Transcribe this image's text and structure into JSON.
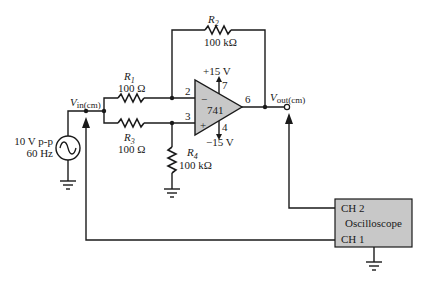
{
  "diagram": {
    "source": {
      "amplitude": "10 V p-p",
      "frequency": "60 Hz",
      "icon": "ac-source-icon"
    },
    "nodes": {
      "vin": {
        "main": "V",
        "sub": "in(cm)"
      },
      "vout": {
        "main": "V",
        "sub": "out(cm)"
      }
    },
    "resistors": [
      {
        "name": "R",
        "sub": "1",
        "value": "100 Ω"
      },
      {
        "name": "R",
        "sub": "2",
        "value": "100 kΩ"
      },
      {
        "name": "R",
        "sub": "3",
        "value": "100 Ω"
      },
      {
        "name": "R",
        "sub": "4",
        "value": "100 kΩ"
      }
    ],
    "opamp": {
      "part": "741",
      "inverting_sign": "−",
      "noninverting_sign": "+",
      "pins": {
        "inv": "2",
        "noninv": "3",
        "out": "6",
        "vpos": "7",
        "vneg": "4"
      },
      "vpos_label": "+15 V",
      "vneg_label": "−15 V",
      "fill_color": "#c8c8c8"
    },
    "oscilloscope": {
      "label": "Oscilloscope",
      "ch2": "CH 2",
      "ch1": "CH 1",
      "fill_color": "#c8c8c8"
    }
  }
}
